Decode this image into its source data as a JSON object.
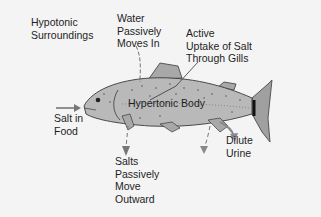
{
  "diagram": {
    "labels": {
      "surroundings": "Hypotonic\nSurroundings",
      "water_in": "Water\nPassively\nMoves In",
      "active_uptake": "Active\nUptake of Salt\nThrough Gills",
      "body": "Hypertonic Body",
      "salt_food": "Salt in\nFood",
      "salts_out": "Salts\nPassively\nMove\nOutward",
      "urine": "Dilute\nUrine"
    },
    "colors": {
      "background": "#f4f4f4",
      "fish_body": "#b9b9b9",
      "fish_outline": "#3a3a3a",
      "arrow": "#777777",
      "text": "#1e1e1e"
    }
  }
}
